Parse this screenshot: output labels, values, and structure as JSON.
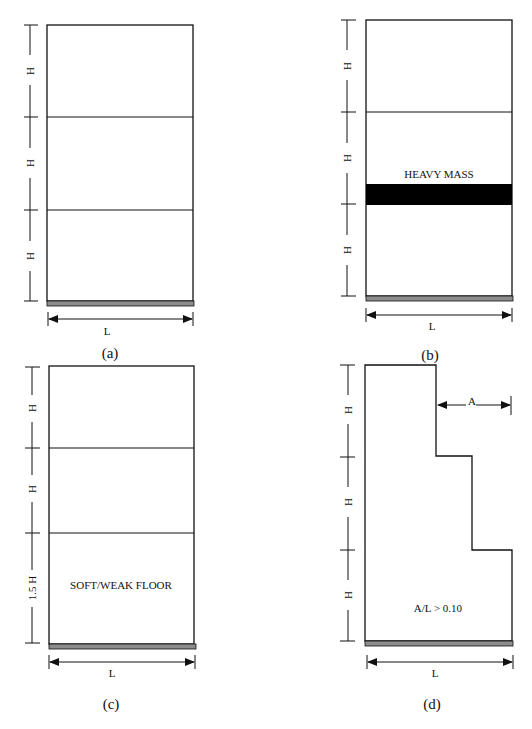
{
  "figure": {
    "panels": [
      {
        "id": "a",
        "caption": "(a)",
        "story_labels": [
          "H",
          "H",
          "H"
        ],
        "width_label": "L",
        "annotation": ""
      },
      {
        "id": "b",
        "caption": "(b)",
        "story_labels": [
          "H",
          "H",
          "H"
        ],
        "width_label": "L",
        "annotation": "HEAVY MASS"
      },
      {
        "id": "c",
        "caption": "(c)",
        "story_labels": [
          "H",
          "H",
          "1.5 H"
        ],
        "width_label": "L",
        "annotation": "SOFT/WEAK FLOOR"
      },
      {
        "id": "d",
        "caption": "(d)",
        "story_labels": [
          "H",
          "H",
          "H"
        ],
        "width_label": "L",
        "setback_label": "A",
        "annotation": "A/L > 0.10"
      }
    ],
    "colors": {
      "line": "#111111",
      "ground": "#8c8c8c",
      "mass": "#000000",
      "background": "#ffffff"
    }
  }
}
